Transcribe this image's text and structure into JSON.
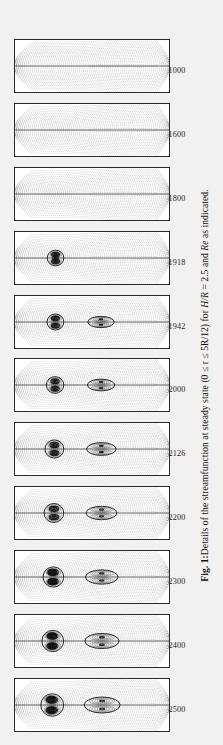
{
  "figure": {
    "label": "Fig. 1:",
    "caption_text": "Details of the streamfunction at steady state (0 ≤ r ≤ 5R/12) for H/R = 2.5 and Re as indicated.",
    "caption_parts": {
      "prefix": "Fig. 1:",
      "body_1": "Details of the streamfunction at steady state (0 ≤ r ≤ 5R/12) for ",
      "math_hr": "H/R",
      "body_2": " = 2.5 and ",
      "math_re": "Re",
      "body_3": " as indicated."
    },
    "aspect_ratio_label": "H/R = 2.5",
    "radial_range_label": "0 ≤ r ≤ 5R/12",
    "parameter_name": "Re",
    "quantity": "streamfunction",
    "state": "steady state",
    "panel_count": 11,
    "orientation": "rotated-90-ccw"
  },
  "panels": [
    {
      "re_label": "1000",
      "re": 1000,
      "bubbles": 0,
      "description": "no vortex breakdown, smooth meridional recirculation"
    },
    {
      "re_label": "1600",
      "re": 1600,
      "bubbles": 0,
      "description": "no vortex breakdown, axial jet narrowing"
    },
    {
      "re_label": "1800",
      "re": 1800,
      "bubbles": 0,
      "description": "incipient axial stagnation, no closed bubble"
    },
    {
      "re_label": "1918",
      "re": 1918,
      "bubbles": 1,
      "description": "first small breakdown bubble appears on axis"
    },
    {
      "re_label": "1942",
      "re": 1942,
      "bubbles": 2,
      "description": "two small bubbles, second downstream bubble forming"
    },
    {
      "re_label": "2000",
      "re": 2000,
      "bubbles": 2,
      "description": "upstream bubble pair plus elongated downstream bubble"
    },
    {
      "re_label": "2126",
      "re": 2126,
      "bubbles": 2,
      "description": "large upstream bubble and separate downstream bubble"
    },
    {
      "re_label": "2200",
      "re": 2200,
      "bubbles": 2,
      "description": "enlarged upstream bubble, elongated downstream bubble"
    },
    {
      "re_label": "2300",
      "re": 2300,
      "bubbles": 2,
      "description": "strongly developed twin breakdown bubbles"
    },
    {
      "re_label": "2400",
      "re": 2400,
      "bubbles": 2,
      "description": "merged upstream lobes, multi-cell downstream structure"
    },
    {
      "re_label": "2500",
      "re": 2500,
      "bubbles": 2,
      "description": "fully developed vortex breakdown, large dark core"
    }
  ],
  "colors": {
    "page_background": "#f2f1ef",
    "panel_background": "#ffffff",
    "panel_border": "#2a2a2a",
    "contour_line": "#3a3a3a",
    "dense_core": "#111111",
    "text": "#141414"
  },
  "chart_data": {
    "type": "line",
    "title": "Details of the streamfunction at steady state",
    "xlabel": "axial coordinate z (0 ≤ z ≤ H)",
    "ylabel": "radial coordinate r (0 ≤ r ≤ 5R/12)",
    "grid": false,
    "legend": "none",
    "series_label": "Re",
    "categories": [
      "1000",
      "1600",
      "1800",
      "1918",
      "1942",
      "2000",
      "2126",
      "2200",
      "2300",
      "2400",
      "2500"
    ],
    "values": [
      0,
      0,
      0,
      1,
      2,
      2,
      2,
      2,
      2,
      2,
      2
    ],
    "series": [
      {
        "name": "number of closed breakdown bubbles",
        "values": [
          0,
          0,
          0,
          1,
          2,
          2,
          2,
          2,
          2,
          2,
          2
        ]
      }
    ],
    "annotations": [
      "H/R = 2.5",
      "0 ≤ r ≤ 5R/12"
    ]
  }
}
